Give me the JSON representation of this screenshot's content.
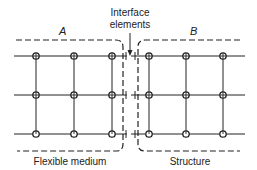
{
  "diagram": {
    "title_label": {
      "line1": "Interface",
      "line2": "elements"
    },
    "regions": [
      {
        "id": "A",
        "label": "A",
        "caption": "Flexible medium"
      },
      {
        "id": "B",
        "label": "B",
        "caption": "Structure"
      }
    ],
    "grid": {
      "rows": 3,
      "columns_per_region": 3,
      "node_symbol": "circle-with-dot"
    },
    "colors": {
      "ink": "#222222",
      "background": "#ffffff"
    }
  }
}
